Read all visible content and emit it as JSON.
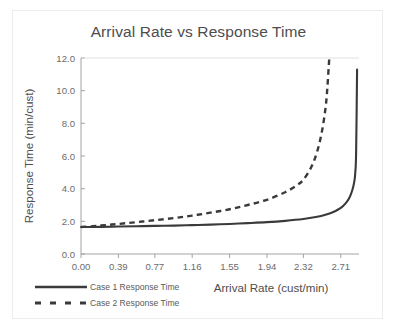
{
  "chart_data": {
    "type": "line",
    "title": "Arrival Rate vs Response Time",
    "xlabel": "Arrival Rate (cust/min)",
    "ylabel": "Response Time (min/cust)",
    "xlim": [
      0.0,
      2.9
    ],
    "ylim": [
      0.0,
      12.0
    ],
    "grid": false,
    "legend_position": "bottom-left",
    "xticks": [
      "0.00",
      "0.39",
      "0.77",
      "1.16",
      "1.55",
      "1.94",
      "2.32",
      "2.71"
    ],
    "xtick_values": [
      0.0,
      0.39,
      0.77,
      1.16,
      1.55,
      1.94,
      2.32,
      2.71
    ],
    "yticks": [
      "0.0",
      "2.0",
      "4.0",
      "6.0",
      "8.0",
      "10.0",
      "12.0"
    ],
    "ytick_values": [
      0.0,
      2.0,
      4.0,
      6.0,
      8.0,
      10.0,
      12.0
    ],
    "series": [
      {
        "name": "Case 1 Response Time",
        "style": "solid",
        "color": "#3a3a3a",
        "x": [
          0.0,
          0.2,
          0.39,
          0.58,
          0.77,
          0.97,
          1.16,
          1.35,
          1.55,
          1.74,
          1.94,
          2.13,
          2.32,
          2.45,
          2.55,
          2.65,
          2.71,
          2.76,
          2.8,
          2.83,
          2.85,
          2.86,
          2.87,
          2.88
        ],
        "y": [
          1.65,
          1.66,
          1.68,
          1.7,
          1.72,
          1.74,
          1.77,
          1.8,
          1.84,
          1.89,
          1.95,
          2.03,
          2.14,
          2.26,
          2.4,
          2.62,
          2.82,
          3.1,
          3.45,
          3.9,
          4.4,
          4.9,
          6.2,
          11.3
        ]
      },
      {
        "name": "Case 2 Response Time",
        "style": "dashed",
        "color": "#3a3a3a",
        "x": [
          0.0,
          0.2,
          0.39,
          0.58,
          0.77,
          0.97,
          1.16,
          1.35,
          1.55,
          1.74,
          1.94,
          2.13,
          2.25,
          2.32,
          2.4,
          2.46,
          2.51,
          2.55,
          2.57,
          2.59
        ],
        "y": [
          1.65,
          1.74,
          1.84,
          1.95,
          2.07,
          2.2,
          2.35,
          2.53,
          2.74,
          3.0,
          3.32,
          3.78,
          4.2,
          4.55,
          5.3,
          6.2,
          7.4,
          8.9,
          10.2,
          12.0
        ]
      }
    ]
  },
  "legend": {
    "items": [
      {
        "label": "Case 1 Response Time",
        "style": "solid"
      },
      {
        "label": "Case 2 Response Time",
        "style": "dashed"
      }
    ]
  }
}
